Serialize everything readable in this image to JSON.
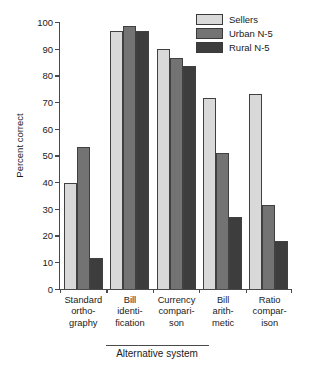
{
  "chart_data": {
    "type": "bar",
    "title": "",
    "xlabel": "Alternative system",
    "ylabel": "Percent correct",
    "ylim": [
      0,
      100
    ],
    "yticks": [
      0,
      10,
      20,
      30,
      40,
      50,
      60,
      70,
      80,
      90,
      100
    ],
    "grid": false,
    "legend_position": "top-right",
    "categories": [
      "Standard ortho- graphy",
      "Bill identi- fication",
      "Currency compari- son",
      "Bill arith- metic",
      "Ratio compar- ison"
    ],
    "category_lines": [
      [
        "Standard",
        "ortho-",
        "graphy"
      ],
      [
        "Bill",
        "identi-",
        "fication"
      ],
      [
        "Currency",
        "compari-",
        "son"
      ],
      [
        "Bill",
        "arith-",
        "metic"
      ],
      [
        "Ratio",
        "compar-",
        "ison"
      ]
    ],
    "series": [
      {
        "name": "Sellers",
        "color": "#d9d9d9",
        "values": [
          39.5,
          96.5,
          90.0,
          71.5,
          73.0
        ]
      },
      {
        "name": "Urban N-5",
        "color": "#737373",
        "values": [
          53.0,
          98.5,
          86.5,
          51.0,
          31.5
        ]
      },
      {
        "name": "Rural N-5",
        "color": "#3d3d3d",
        "values": [
          11.5,
          96.5,
          83.5,
          27.0,
          18.0
        ]
      }
    ]
  }
}
